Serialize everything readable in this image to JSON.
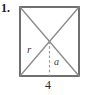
{
  "figure": {
    "problem_number": "1.",
    "shape_name": "square",
    "labels": {
      "radius": "r",
      "apothem": "a",
      "side_length": "4"
    },
    "colors": {
      "outline": "#4d4d4d",
      "diagonal": "#8a8a8a",
      "apothem_dashed": "#9a9a9a",
      "text": "#2b2b2b",
      "background": "#ffffff"
    },
    "geometry": {
      "square_left": 20,
      "square_top": 7,
      "square_right": 79,
      "square_bottom": 76,
      "center_x": 49.5,
      "center_y": 41.5
    }
  }
}
